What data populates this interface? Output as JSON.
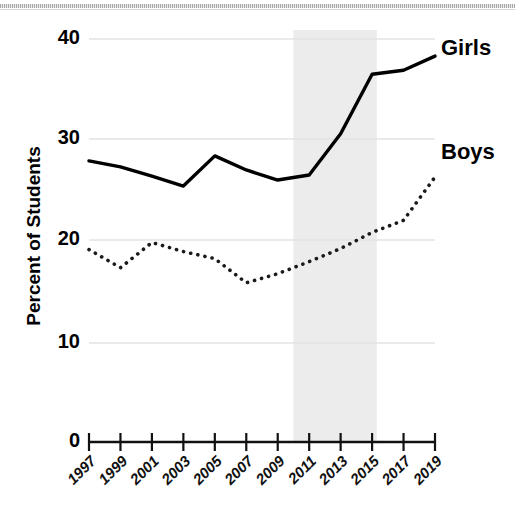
{
  "chart_data": {
    "type": "line",
    "title": "",
    "xlabel": "",
    "ylabel": "Percent of Students",
    "ylim": [
      0,
      40
    ],
    "yticks": [
      0,
      10,
      20,
      30,
      40
    ],
    "ytick_labels": [
      "0",
      "10",
      "20",
      "30",
      "40"
    ],
    "grid": true,
    "grid_axis": "y",
    "legend_position": "inline-right",
    "x": [
      1997,
      1999,
      2001,
      2003,
      2005,
      2007,
      2009,
      2011,
      2013,
      2015,
      2017,
      2019
    ],
    "xtick_labels": [
      "1997",
      "1999",
      "2001",
      "2003",
      "2005",
      "2007",
      "2009",
      "2011",
      "2013",
      "2015",
      "2017",
      "2019"
    ],
    "series": [
      {
        "name": "Girls",
        "style": "solid",
        "color": "#000000",
        "values": [
          27.9,
          27.3,
          26.4,
          25.4,
          28.4,
          27.0,
          26.0,
          26.5,
          30.6,
          36.5,
          36.9,
          38.3
        ]
      },
      {
        "name": "Boys",
        "style": "dotted",
        "color": "#1a1a1a",
        "values": [
          19.1,
          17.3,
          19.8,
          18.9,
          18.2,
          15.8,
          16.7,
          17.9,
          19.2,
          20.8,
          22.0,
          26.3
        ]
      }
    ],
    "shaded_region": {
      "label": "",
      "x_start": 2010.0,
      "x_end": 2015.3,
      "color": "#ececec"
    },
    "annotations": [
      {
        "text": "Girls",
        "series": "Girls",
        "x": 2019,
        "y": 38.3
      },
      {
        "text": "Boys",
        "series": "Boys",
        "x": 2019,
        "y": 26.3
      }
    ]
  },
  "axis": {
    "y_title": "Percent of Students"
  }
}
